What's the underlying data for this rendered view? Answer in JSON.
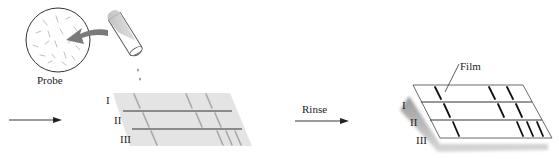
{
  "labels": {
    "probe": "Probe",
    "rinse": "Rinse",
    "film": "Film",
    "lane_1": "I",
    "lane_2": "II",
    "lane_3": "III",
    "lane_1_film": "I",
    "lane_2_film": "II",
    "lane_3_film": "III"
  },
  "colors": {
    "membrane": "#e4e4e4",
    "membrane_band": "#a8a8a8",
    "film": "#ffffff",
    "film_band": "#111111",
    "line": "#333333",
    "probe_arrow": "#7a7a7a"
  }
}
